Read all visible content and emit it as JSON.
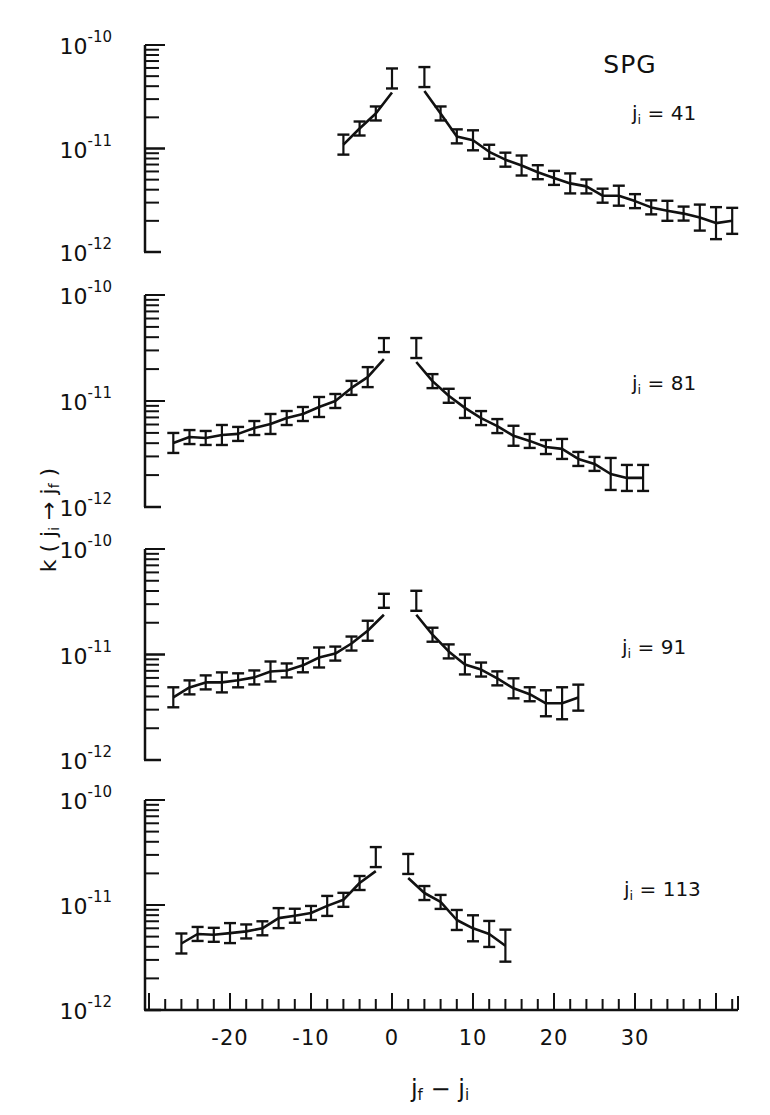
{
  "chart_data": {
    "type": "scatter",
    "title": "SPG",
    "xlabel": "jf − ji",
    "ylabel": "k(ji → jf)",
    "yscale": "log",
    "xlim": [
      -30,
      43
    ],
    "x_ticks": [
      -20,
      -10,
      0,
      10,
      20,
      30
    ],
    "x_tick_labels": [
      "-20",
      "-10",
      "0",
      "10",
      "20",
      "30"
    ],
    "minor_x_step": 2,
    "y_tick_labels": [
      "10^-10",
      "10^-11",
      "10^-12"
    ],
    "ylim": [
      1e-12,
      1e-10
    ],
    "grid": false,
    "legend": null,
    "panels": [
      {
        "label": "ji = 41",
        "ji": 41,
        "series": [
          {
            "name": "data (with error bars)",
            "side": "left",
            "x": [
              -6,
              -4,
              -2,
              0
            ],
            "y": [
              1.09e-11,
              1.56e-11,
              2.18e-11,
              4.75e-11
            ]
          },
          {
            "name": "data (with error bars)",
            "side": "right",
            "x": [
              4,
              6,
              8,
              10,
              12,
              14,
              16,
              18,
              20,
              22,
              24,
              26,
              28,
              30,
              32,
              34,
              36,
              38,
              40,
              42
            ],
            "y": [
              4.9e-11,
              2.18e-11,
              1.31e-11,
              1.2e-11,
              9.3e-12,
              7.8e-12,
              6.85e-12,
              5.9e-12,
              5.2e-12,
              4.6e-12,
              4.3e-12,
              3.5e-12,
              3.5e-12,
              3.1e-12,
              2.7e-12,
              2.5e-12,
              2.35e-12,
              2.15e-12,
              1.9e-12,
              2e-12
            ]
          }
        ]
      },
      {
        "label": "ji = 81",
        "ji": 81,
        "series": [
          {
            "name": "data (with error bars)",
            "side": "left",
            "x": [
              -27,
              -25,
              -23,
              -21,
              -19,
              -17,
              -15,
              -13,
              -11,
              -9,
              -7,
              -5,
              -3,
              -1
            ],
            "y": [
              4.02e-12,
              4.57e-12,
              4.48e-12,
              4.78e-12,
              4.89e-12,
              5.56e-12,
              6.07e-12,
              6.91e-12,
              7.54e-12,
              8.78e-12,
              1e-11,
              1.33e-11,
              1.68e-11,
              3.37e-11
            ]
          },
          {
            "name": "data (with error bars)",
            "side": "right",
            "x": [
              3,
              5,
              7,
              9,
              11,
              13,
              15,
              17,
              19,
              21,
              23,
              25,
              27,
              29,
              31
            ],
            "y": [
              3.16e-11,
              1.54e-11,
              1.12e-11,
              8.6e-12,
              6.9e-12,
              5.8e-12,
              4.7e-12,
              4.2e-12,
              3.68e-12,
              3.53e-12,
              2.84e-12,
              2.55e-12,
              2.05e-12,
              1.88e-12,
              1.88e-12
            ]
          }
        ]
      },
      {
        "label": "ji = 91",
        "ji": 91,
        "series": [
          {
            "name": "data (with error bars)",
            "side": "left",
            "x": [
              -27,
              -25,
              -23,
              -21,
              -19,
              -17,
              -15,
              -13,
              -11,
              -9,
              -7,
              -5,
              -3,
              -1
            ],
            "y": [
              3.93e-12,
              4.88e-12,
              5.44e-12,
              5.44e-12,
              5.69e-12,
              6.06e-12,
              6.9e-12,
              7.06e-12,
              7.9e-12,
              9.37e-12,
              1.02e-11,
              1.27e-11,
              1.68e-11,
              3.23e-11
            ]
          },
          {
            "name": "data (with error bars)",
            "side": "right",
            "x": [
              3,
              5,
              7,
              9,
              11,
              13,
              15,
              17,
              19,
              21,
              23
            ],
            "y": [
              3.23e-11,
              1.54e-11,
              1.07e-11,
              8.05e-12,
              7.2e-12,
              5.94e-12,
              4.78e-12,
              4.2e-12,
              3.45e-12,
              3.45e-12,
              3.9e-12
            ]
          }
        ]
      },
      {
        "label": "ji = 113",
        "ji": 113,
        "series": [
          {
            "name": "data (with error bars)",
            "side": "left",
            "x": [
              -26,
              -24,
              -22,
              -20,
              -18,
              -16,
              -14,
              -12,
              -10,
              -8,
              -6,
              -4,
              -2
            ],
            "y": [
              4.3e-12,
              5.3e-12,
              5.2e-12,
              5.4e-12,
              5.6e-12,
              6e-12,
              7.5e-12,
              7.9e-12,
              8.4e-12,
              9.8e-12,
              1.12e-11,
              1.62e-11,
              2.86e-11
            ]
          },
          {
            "name": "data (with error bars)",
            "side": "right",
            "x": [
              2,
              4,
              6,
              8,
              10,
              12,
              14
            ],
            "y": [
              2.46e-11,
              1.3e-11,
              1.07e-11,
              7.2e-12,
              6e-12,
              5.3e-12,
              4.1e-12
            ]
          }
        ]
      }
    ]
  },
  "figure": {
    "title": "SPG",
    "xlabel_main": "j",
    "xlabel_sub1": "f",
    "xlabel_mid": " − j",
    "xlabel_sub2": "i",
    "ylabel": "k ( j",
    "ylabel_sub": "i",
    "ylabel_arrow": " → j",
    "ylabel_sub2": "f",
    "ylabel_close": " )"
  }
}
